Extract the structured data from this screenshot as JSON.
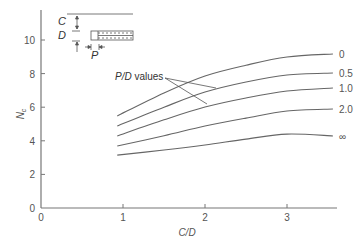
{
  "chart_data": {
    "type": "line",
    "title": "",
    "xlabel": "C/D",
    "ylabel": "N_c",
    "ylabel_main": "N",
    "ylabel_sub": "c",
    "xlim": [
      0,
      3.6
    ],
    "ylim": [
      0,
      11
    ],
    "xticks": [
      0,
      1,
      2,
      3
    ],
    "yticks": [
      0,
      2,
      4,
      6,
      8,
      10
    ],
    "grid": false,
    "legend_position": "right-end labels",
    "annotation": {
      "text_italic": "P/D",
      "text": " values"
    },
    "series": [
      {
        "name": "0",
        "x": [
          0.93,
          1.5,
          2.0,
          2.5,
          3.0,
          3.56
        ],
        "values": [
          5.48,
          6.85,
          7.86,
          8.5,
          8.99,
          9.17
        ]
      },
      {
        "name": "0.5",
        "x": [
          0.93,
          1.5,
          2.0,
          2.5,
          3.0,
          3.56
        ],
        "values": [
          4.88,
          6.0,
          6.9,
          7.5,
          7.92,
          8.04
        ]
      },
      {
        "name": "1.0",
        "x": [
          0.93,
          1.5,
          2.0,
          2.5,
          3.0,
          3.56
        ],
        "values": [
          4.29,
          5.25,
          6.01,
          6.55,
          6.96,
          7.14
        ]
      },
      {
        "name": "2.0",
        "x": [
          0.93,
          1.5,
          2.0,
          2.5,
          3.0,
          3.56
        ],
        "values": [
          3.69,
          4.3,
          4.88,
          5.35,
          5.77,
          5.89
        ]
      },
      {
        "name": "∞",
        "x": [
          0.93,
          1.5,
          2.0,
          2.5,
          3.0,
          3.56
        ],
        "values": [
          3.15,
          3.45,
          3.75,
          4.1,
          4.4,
          4.29
        ]
      }
    ],
    "inset": {
      "labels": [
        "C",
        "D",
        "P"
      ]
    }
  }
}
